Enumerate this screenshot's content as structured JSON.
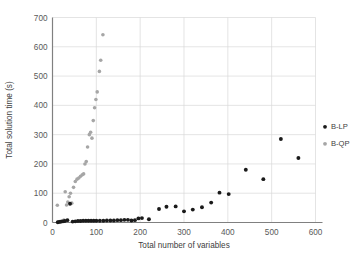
{
  "chart_data": {
    "type": "scatter",
    "title": "",
    "xlabel": "Total number of variables",
    "ylabel": "Total solution time (s)",
    "xlim": [
      0,
      600
    ],
    "ylim": [
      0,
      700
    ],
    "xticks": [
      0,
      100,
      200,
      300,
      400,
      500,
      600
    ],
    "yticks": [
      0,
      100,
      200,
      300,
      400,
      500,
      600,
      700
    ],
    "grid": "horizontal-and-vertical",
    "legend_position": "right",
    "series": [
      {
        "name": "B-LP",
        "color": "#1a1a1a",
        "marker": "circle",
        "points": [
          [
            12,
            1
          ],
          [
            16,
            2
          ],
          [
            20,
            3
          ],
          [
            24,
            4
          ],
          [
            28,
            5
          ],
          [
            34,
            8
          ],
          [
            40,
            64
          ],
          [
            46,
            3
          ],
          [
            52,
            4
          ],
          [
            58,
            5
          ],
          [
            64,
            5
          ],
          [
            70,
            6
          ],
          [
            76,
            6
          ],
          [
            82,
            6
          ],
          [
            88,
            6
          ],
          [
            94,
            6
          ],
          [
            100,
            6
          ],
          [
            108,
            6
          ],
          [
            116,
            6
          ],
          [
            124,
            7
          ],
          [
            132,
            7
          ],
          [
            140,
            7
          ],
          [
            148,
            8
          ],
          [
            156,
            8
          ],
          [
            164,
            9
          ],
          [
            172,
            9
          ],
          [
            180,
            7
          ],
          [
            188,
            8
          ],
          [
            196,
            14
          ],
          [
            204,
            15
          ],
          [
            220,
            11
          ],
          [
            243,
            46
          ],
          [
            260,
            54
          ],
          [
            281,
            55
          ],
          [
            300,
            38
          ],
          [
            320,
            44
          ],
          [
            341,
            52
          ],
          [
            362,
            68
          ],
          [
            381,
            102
          ],
          [
            402,
            97
          ],
          [
            441,
            180
          ],
          [
            481,
            148
          ],
          [
            521,
            285
          ],
          [
            561,
            220
          ]
        ]
      },
      {
        "name": "B-QP",
        "color": "#a6a6a6",
        "marker": "circle",
        "points": [
          [
            11,
            59
          ],
          [
            14,
            2
          ],
          [
            17,
            3
          ],
          [
            20,
            4
          ],
          [
            23,
            5
          ],
          [
            26,
            8
          ],
          [
            29,
            105
          ],
          [
            32,
            60
          ],
          [
            35,
            70
          ],
          [
            38,
            88
          ],
          [
            41,
            100
          ],
          [
            44,
            66
          ],
          [
            48,
            120
          ],
          [
            52,
            140
          ],
          [
            56,
            148
          ],
          [
            60,
            152
          ],
          [
            64,
            158
          ],
          [
            68,
            163
          ],
          [
            71,
            166
          ],
          [
            74,
            200
          ],
          [
            77,
            208
          ],
          [
            80,
            258
          ],
          [
            84,
            300
          ],
          [
            87,
            308
          ],
          [
            90,
            288
          ],
          [
            93,
            348
          ],
          [
            96,
            392
          ],
          [
            99,
            420
          ],
          [
            102,
            446
          ],
          [
            107,
            516
          ],
          [
            110,
            554
          ],
          [
            115,
            641
          ]
        ]
      }
    ],
    "legend": [
      {
        "label": "B-LP",
        "color": "#1a1a1a"
      },
      {
        "label": "B-QP",
        "color": "#a6a6a6"
      }
    ]
  },
  "caption": {
    "text": ""
  }
}
